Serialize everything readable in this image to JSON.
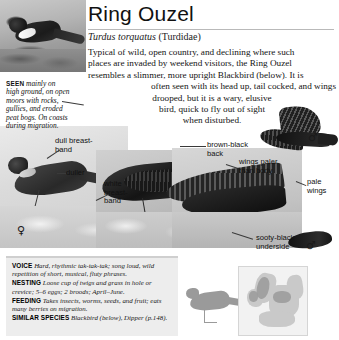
{
  "header": {
    "common_name": "Ring Ouzel",
    "scientific_name": "Turdus torquatus",
    "family": "(Turdidae)"
  },
  "description": {
    "lines": [
      "Typical of wild, open country, and declining where such",
      "places are invaded by weekend visitors, the Ring Ouzel",
      "resembles a slimmer, more upright Blackbird (below). It is",
      "often seen with its head up, tail cocked, and wings",
      "drooped, but it is a wary, elusive",
      "bird, quick to fly out of sight",
      "when disturbed."
    ]
  },
  "habitat_caption": {
    "keyword": "SEEN",
    "text": "mainly on high ground, on open moors with rocks, gullies, and eroded peat bogs. On coasts during migration."
  },
  "callouts": [
    {
      "name": "dull-breast-band",
      "text": "dull breast-band"
    },
    {
      "name": "duller",
      "text": "duller"
    },
    {
      "name": "white-breast-band",
      "text": "white breast-band"
    },
    {
      "name": "brown-black-back",
      "text": "brown-black back"
    },
    {
      "name": "wings-paler-than-body",
      "text": "wings paler than body"
    },
    {
      "name": "pale-wings",
      "text": "pale wings"
    },
    {
      "name": "sooty-black-underside",
      "text": "sooty-black underside"
    }
  ],
  "sex_symbols": {
    "female": "♀",
    "male": "♂"
  },
  "info_panel": {
    "rows": [
      {
        "label": "VOICE",
        "text": "Hard, rhythmic tak-tak-tak; song loud, wild repetition of short, musical, fluty phrases."
      },
      {
        "label": "NESTING",
        "text": "Loose cup of twigs and grass in hole or crevice; 5–6 eggs; 2 broods; April–June."
      },
      {
        "label": "FEEDING",
        "text": "Takes insects, worms, seeds, and fruit; eats many berries on migration."
      },
      {
        "label": "SIMILAR SPECIES",
        "text": "Blackbird (below), Dipper (p.148)."
      }
    ]
  },
  "map": {
    "name": "europe-distribution-map"
  },
  "colors": {
    "panel_background": "#ededed",
    "panel_rule": "#cfcfcf",
    "title_rule": "#b9b9b9",
    "text": "#141414"
  }
}
